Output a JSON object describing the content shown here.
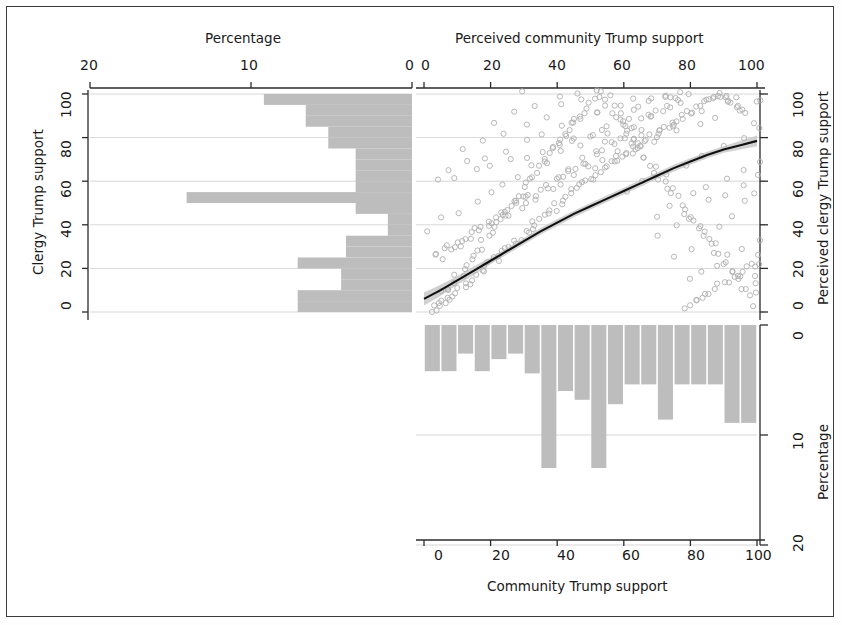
{
  "figure": {
    "kind": "scatterplot-with-marginal-histograms",
    "background": "#ffffff",
    "frame_color": "#3c3c3c",
    "bar_color": "#bdbdbd",
    "point_color": "#b0b0b0",
    "fit_color": "#111111",
    "band_color": "#c9c9c9"
  },
  "axes": {
    "top_title": "Perceived community Trump support",
    "top_left_title": "Percentage",
    "left_title": "Clergy Trump support",
    "right_title": "Perceived clergy Trump support",
    "right_bottom_title": "Percentage",
    "bottom_title": "Community Trump support",
    "top_left_ticks": [
      "20",
      "10",
      "0"
    ],
    "top_right_ticks": [
      "0",
      "20",
      "40",
      "60",
      "80",
      "100"
    ],
    "left_ticks": [
      "0",
      "20",
      "40",
      "60",
      "80",
      "100"
    ],
    "right_top_ticks": [
      "0",
      "20",
      "40",
      "60",
      "80",
      "100"
    ],
    "right_bottom_ticks": [
      "0",
      "10",
      "20"
    ],
    "bottom_ticks": [
      "0",
      "20",
      "40",
      "60",
      "80",
      "100"
    ]
  },
  "chart_data": {
    "type": "scatter",
    "xlabel": "Community Trump support",
    "ylabel": "Clergy Trump support",
    "x2label": "Perceived community Trump support",
    "y2label": "Perceived clergy Trump support",
    "xlim": [
      0,
      100
    ],
    "ylim": [
      0,
      100
    ],
    "grid": true,
    "legend": "none",
    "scatter": {
      "marker": "open-circle",
      "n_points": 460,
      "x": [
        2,
        3,
        4,
        4,
        5,
        5,
        6,
        6,
        7,
        7,
        8,
        8,
        9,
        9,
        10,
        10,
        11,
        11,
        12,
        12,
        13,
        13,
        14,
        14,
        15,
        15,
        16,
        16,
        17,
        17,
        18,
        18,
        19,
        19,
        20,
        20,
        21,
        21,
        22,
        22,
        23,
        23,
        24,
        24,
        25,
        25,
        26,
        26,
        27,
        27,
        28,
        28,
        29,
        29,
        30,
        30,
        31,
        31,
        32,
        32,
        33,
        33,
        34,
        34,
        35,
        35,
        36,
        36,
        37,
        37,
        38,
        38,
        39,
        39,
        40,
        40,
        41,
        41,
        42,
        42,
        43,
        43,
        44,
        44,
        45,
        45,
        46,
        46,
        47,
        47,
        48,
        48,
        49,
        49,
        50,
        50,
        51,
        51,
        52,
        52,
        53,
        53,
        54,
        54,
        55,
        55,
        56,
        56,
        57,
        57,
        58,
        58,
        59,
        59,
        60,
        60,
        61,
        61,
        62,
        62,
        63,
        63,
        64,
        64,
        65,
        65,
        66,
        66,
        67,
        67,
        68,
        68,
        69,
        69,
        70,
        70,
        71,
        71,
        72,
        72,
        73,
        73,
        74,
        74,
        75,
        75,
        76,
        76,
        77,
        77,
        78,
        78,
        79,
        79,
        80,
        80,
        81,
        81,
        82,
        82,
        83,
        83,
        84,
        84,
        85,
        85,
        86,
        86,
        87,
        87,
        88,
        88,
        89,
        89,
        90,
        90,
        91,
        91,
        92,
        92,
        93,
        93,
        94,
        94,
        95,
        95,
        96,
        96,
        97,
        97,
        98,
        98,
        99,
        99,
        100,
        100,
        5,
        8,
        12,
        15,
        18,
        22,
        26,
        30,
        34,
        38,
        42,
        46,
        50,
        54,
        58,
        62,
        66,
        70,
        74,
        78,
        82,
        86,
        90,
        94,
        98,
        3,
        7,
        11,
        16,
        21,
        25,
        29,
        33,
        37,
        41,
        45,
        49,
        53,
        57,
        61,
        65,
        69,
        73,
        77,
        81,
        85,
        89,
        93,
        97,
        100,
        6,
        10,
        14,
        19,
        23,
        27,
        31,
        35,
        39,
        43,
        47,
        51,
        55,
        59,
        63,
        67,
        71,
        75,
        79,
        83,
        87,
        91,
        95,
        99,
        4,
        9,
        13,
        17,
        20,
        24,
        28,
        32,
        36,
        40,
        44,
        48,
        52,
        56,
        60,
        64,
        68,
        72,
        76,
        80,
        84,
        88,
        92,
        96,
        100,
        2,
        6,
        11,
        16,
        20,
        24,
        28,
        33,
        37,
        42,
        46,
        50,
        55,
        60,
        64,
        68,
        72,
        76,
        80,
        85,
        89,
        93,
        97,
        100,
        5,
        10,
        15,
        20,
        25,
        30,
        35,
        40,
        45,
        50,
        55,
        60,
        65,
        70,
        75,
        80,
        85,
        90,
        95,
        100,
        8,
        14,
        19,
        25,
        31,
        36,
        41,
        47,
        52,
        58,
        63,
        69,
        74,
        80,
        85,
        91,
        96,
        100,
        12,
        18,
        24,
        30,
        36,
        42,
        48,
        54,
        60,
        66,
        72,
        78,
        84,
        90,
        96,
        100,
        22,
        28,
        34,
        40,
        46,
        52,
        58,
        64,
        70,
        76,
        82,
        88,
        94,
        100,
        30,
        38,
        46,
        54,
        62,
        70,
        78,
        86,
        94,
        100,
        44,
        52,
        60,
        68,
        76,
        84,
        92,
        100,
        56,
        64,
        72,
        80,
        88,
        96,
        100,
        66,
        74,
        82,
        90,
        98,
        76,
        84,
        92,
        100,
        86,
        94,
        100
      ],
      "y": [
        1,
        2,
        2,
        4,
        3,
        6,
        4,
        8,
        5,
        10,
        6,
        12,
        8,
        14,
        9,
        16,
        10,
        18,
        12,
        20,
        13,
        22,
        14,
        24,
        16,
        26,
        17,
        28,
        18,
        30,
        20,
        32,
        21,
        34,
        22,
        36,
        24,
        38,
        25,
        40,
        26,
        42,
        28,
        44,
        29,
        46,
        30,
        48,
        32,
        50,
        33,
        52,
        34,
        54,
        36,
        56,
        37,
        58,
        38,
        60,
        40,
        62,
        41,
        64,
        42,
        66,
        44,
        68,
        45,
        70,
        46,
        72,
        47,
        74,
        49,
        76,
        50,
        78,
        51,
        80,
        52,
        82,
        54,
        84,
        55,
        86,
        56,
        88,
        57,
        90,
        58,
        92,
        60,
        94,
        61,
        96,
        62,
        98,
        63,
        100,
        64,
        98,
        66,
        96,
        67,
        94,
        68,
        92,
        69,
        90,
        70,
        88,
        71,
        86,
        72,
        84,
        73,
        82,
        74,
        80,
        75,
        78,
        76,
        76,
        77,
        74,
        78,
        72,
        79,
        70,
        80,
        68,
        81,
        66,
        82,
        64,
        83,
        62,
        84,
        60,
        85,
        58,
        86,
        56,
        87,
        54,
        88,
        52,
        89,
        50,
        90,
        48,
        91,
        46,
        92,
        44,
        93,
        42,
        94,
        40,
        95,
        38,
        96,
        36,
        97,
        34,
        98,
        32,
        99,
        30,
        100,
        28,
        99,
        26,
        98,
        24,
        97,
        22,
        96,
        20,
        95,
        18,
        94,
        16,
        93,
        14,
        92,
        12,
        91,
        10,
        4,
        7,
        10,
        14,
        17,
        21,
        24,
        28,
        31,
        35,
        38,
        42,
        45,
        49,
        52,
        56,
        59,
        63,
        66,
        70,
        73,
        77,
        80,
        84,
        87,
        2,
        5,
        9,
        13,
        17,
        21,
        25,
        29,
        33,
        37,
        41,
        45,
        49,
        53,
        57,
        61,
        65,
        69,
        73,
        77,
        81,
        85,
        89,
        93,
        96,
        6,
        9,
        13,
        17,
        21,
        25,
        29,
        33,
        37,
        41,
        45,
        49,
        53,
        57,
        61,
        65,
        69,
        73,
        77,
        81,
        85,
        89,
        93,
        97,
        3,
        7,
        11,
        15,
        18,
        22,
        26,
        30,
        34,
        38,
        42,
        46,
        50,
        54,
        58,
        62,
        66,
        70,
        74,
        78,
        82,
        86,
        90,
        94,
        98,
        15,
        18,
        22,
        26,
        30,
        34,
        38,
        42,
        46,
        50,
        54,
        58,
        62,
        66,
        70,
        74,
        78,
        82,
        86,
        90,
        94,
        98,
        100,
        25,
        30,
        35,
        40,
        45,
        50,
        55,
        60,
        62,
        65,
        68,
        70,
        72,
        74,
        76,
        78,
        80,
        82,
        85,
        88,
        35,
        40,
        45,
        50,
        55,
        58,
        62,
        65,
        68,
        72,
        75,
        78,
        82,
        85,
        88,
        92,
        95,
        98,
        45,
        50,
        54,
        58,
        62,
        66,
        70,
        74,
        78,
        82,
        86,
        90,
        94,
        97,
        100,
        55,
        60,
        64,
        68,
        72,
        76,
        80,
        84,
        88,
        92,
        95,
        98,
        100,
        65,
        70,
        74,
        78,
        82,
        86,
        90,
        94,
        97,
        100,
        75,
        80,
        84,
        88,
        92,
        95,
        98,
        100,
        85,
        88,
        92,
        95,
        98,
        100,
        92,
        95,
        98,
        100,
        95,
        98,
        100,
        100
      ]
    },
    "fit_curve": {
      "description": "LOESS/GAM smoothed fit with confidence band",
      "x": [
        0,
        5,
        10,
        15,
        20,
        25,
        30,
        35,
        40,
        45,
        50,
        55,
        60,
        65,
        70,
        75,
        80,
        85,
        90,
        95,
        100
      ],
      "y": [
        6,
        10,
        14.5,
        19,
        23.5,
        28,
        32.5,
        37,
        41,
        45,
        48.5,
        52,
        55.5,
        59,
        62.5,
        66,
        69,
        72,
        74.5,
        76.5,
        78.5
      ],
      "band_upper": [
        9,
        12.5,
        16.5,
        21,
        25,
        29.5,
        34,
        38.5,
        42.5,
        46.5,
        50,
        53.5,
        57,
        60.5,
        64,
        67.5,
        70.5,
        73.5,
        76,
        78.5,
        81
      ],
      "band_lower": [
        3,
        7.5,
        12.5,
        17,
        22,
        26.5,
        31,
        35.5,
        39.5,
        43.5,
        47,
        50.5,
        54,
        57.5,
        61,
        64.5,
        67.5,
        70.5,
        73,
        74.5,
        76
      ]
    },
    "left_histogram": {
      "orientation": "horizontal",
      "description": "Clergy Trump support distribution; percentage axis reversed (0 at right, 20 at left)",
      "xlabel": "Percentage",
      "ylabel": "Clergy Trump support",
      "xlim": [
        0,
        20
      ],
      "bin_centers": [
        2.5,
        7.5,
        12.5,
        17.5,
        22.5,
        27.5,
        32.5,
        37.5,
        42.5,
        47.5,
        52.5,
        57.5,
        62.5,
        67.5,
        72.5,
        77.5,
        82.5,
        87.5,
        92.5,
        97.5
      ],
      "bin_edges": [
        0,
        5,
        10,
        15,
        20,
        25,
        30,
        35,
        40,
        45,
        50,
        55,
        60,
        65,
        70,
        75,
        80,
        85,
        90,
        95,
        100
      ],
      "values": [
        7.1,
        7.1,
        4.4,
        4.4,
        7.1,
        4.1,
        4.1,
        1.5,
        1.5,
        3.5,
        14.0,
        3.5,
        3.5,
        3.5,
        3.5,
        5.2,
        5.2,
        6.6,
        6.6,
        9.2
      ]
    },
    "bottom_histogram": {
      "orientation": "vertical",
      "description": "Community Trump support distribution; percentage axis inverted (0 at top, 20 at bottom)",
      "xlabel": "Community Trump support",
      "ylabel": "Percentage",
      "ylim": [
        0,
        20
      ],
      "bin_centers": [
        2.5,
        7.5,
        12.5,
        17.5,
        22.5,
        27.5,
        32.5,
        37.5,
        42.5,
        47.5,
        52.5,
        57.5,
        62.5,
        67.5,
        72.5,
        77.5,
        82.5,
        87.5,
        92.5,
        97.5
      ],
      "bin_edges": [
        0,
        5,
        10,
        15,
        20,
        25,
        30,
        35,
        40,
        45,
        50,
        55,
        60,
        65,
        70,
        75,
        80,
        85,
        90,
        95,
        100
      ],
      "values": [
        4.2,
        4.2,
        2.6,
        4.2,
        3.1,
        2.6,
        4.4,
        13.0,
        6.0,
        6.8,
        13.0,
        7.2,
        5.4,
        5.4,
        8.6,
        5.4,
        5.4,
        5.4,
        8.9,
        8.9
      ]
    }
  }
}
